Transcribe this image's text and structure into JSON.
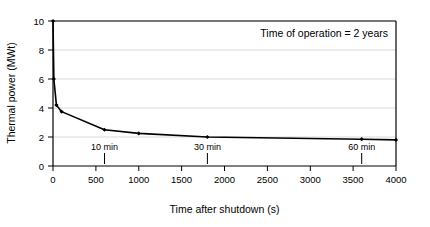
{
  "chart_data": {
    "type": "line",
    "title": "",
    "xlabel": "Time after shutdown (s)",
    "ylabel": "Thermal power (MWt)",
    "xlim": [
      0,
      4000
    ],
    "ylim": [
      0,
      10
    ],
    "xticks": [
      0,
      500,
      1000,
      1500,
      2000,
      2500,
      3000,
      3500,
      4000
    ],
    "xtick_labels": [
      "0",
      "500",
      "1000",
      "1500",
      "2000",
      "2500",
      "3000",
      "3500",
      "4000"
    ],
    "yticks": [
      0,
      2,
      4,
      6,
      8,
      10
    ],
    "ytick_labels": [
      "0",
      "2",
      "4",
      "6",
      "8",
      "10"
    ],
    "grid": "horizontal",
    "legend": "none",
    "series": [
      {
        "name": "Decay heat",
        "color": "#000000",
        "marker": "diamond",
        "x": [
          0,
          10,
          40,
          100,
          600,
          1000,
          1800,
          3600,
          4000
        ],
        "y": [
          10.0,
          6.0,
          4.2,
          3.75,
          2.5,
          2.25,
          2.0,
          1.85,
          1.8
        ]
      }
    ],
    "annotations": [
      {
        "text": "Time of operation = 2 years",
        "x": 3150,
        "y": 9.0
      },
      {
        "text": "10 min",
        "x": 600,
        "y": 1.0,
        "marker_x": 600
      },
      {
        "text": "30 min",
        "x": 1800,
        "y": 1.0,
        "marker_x": 1800
      },
      {
        "text": "60 min",
        "x": 3600,
        "y": 1.0,
        "marker_x": 3600
      }
    ]
  },
  "labels": {
    "xlabel": "Time after shutdown (s)",
    "ylabel": "Thermal power (MWt)",
    "note": "Time of operation = 2 years",
    "marker_10min": "10 min",
    "marker_30min": "30 min",
    "marker_60min": "60 min",
    "xtick_0": "0",
    "xtick_500": "500",
    "xtick_1000": "1000",
    "xtick_1500": "1500",
    "xtick_2000": "2000",
    "xtick_2500": "2500",
    "xtick_3000": "3000",
    "xtick_3500": "3500",
    "xtick_4000": "4000",
    "ytick_0": "0",
    "ytick_2": "2",
    "ytick_4": "4",
    "ytick_6": "6",
    "ytick_8": "8",
    "ytick_10": "10"
  },
  "colors": {
    "line": "#000000",
    "grid": "#d9d9d9",
    "axis": "#000000",
    "background": "#ffffff"
  }
}
